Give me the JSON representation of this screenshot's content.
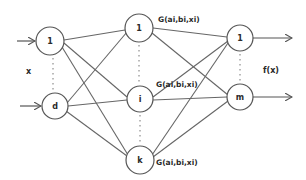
{
  "diagram": {
    "input_label": "x",
    "output_label": "f(x)",
    "layers": [
      {
        "name": "input",
        "nodes": [
          {
            "id": "in-1",
            "label": "1",
            "cx": 50,
            "cy": 41,
            "r": 14
          },
          {
            "id": "in-d",
            "label": "d",
            "cx": 55,
            "cy": 106,
            "r": 13
          }
        ]
      },
      {
        "name": "hidden",
        "nodes": [
          {
            "id": "h-1",
            "label": "1",
            "cx": 139,
            "cy": 28,
            "r": 14,
            "annotation": "G(ai,bi,xi)"
          },
          {
            "id": "h-i",
            "label": "i",
            "cx": 140,
            "cy": 99,
            "r": 13,
            "annotation": "G(ai,bi,xi)"
          },
          {
            "id": "h-k",
            "label": "k",
            "cx": 140,
            "cy": 160,
            "r": 14,
            "annotation": "G(ai,bi,xi)"
          }
        ]
      },
      {
        "name": "output",
        "nodes": [
          {
            "id": "out-1",
            "label": "1",
            "cx": 240,
            "cy": 38,
            "r": 13
          },
          {
            "id": "out-m",
            "label": "m",
            "cx": 240,
            "cy": 97,
            "r": 13
          }
        ]
      }
    ],
    "colors": {
      "stroke": "#555555",
      "text": "#2a2a2a",
      "background": "#ffffff"
    }
  }
}
